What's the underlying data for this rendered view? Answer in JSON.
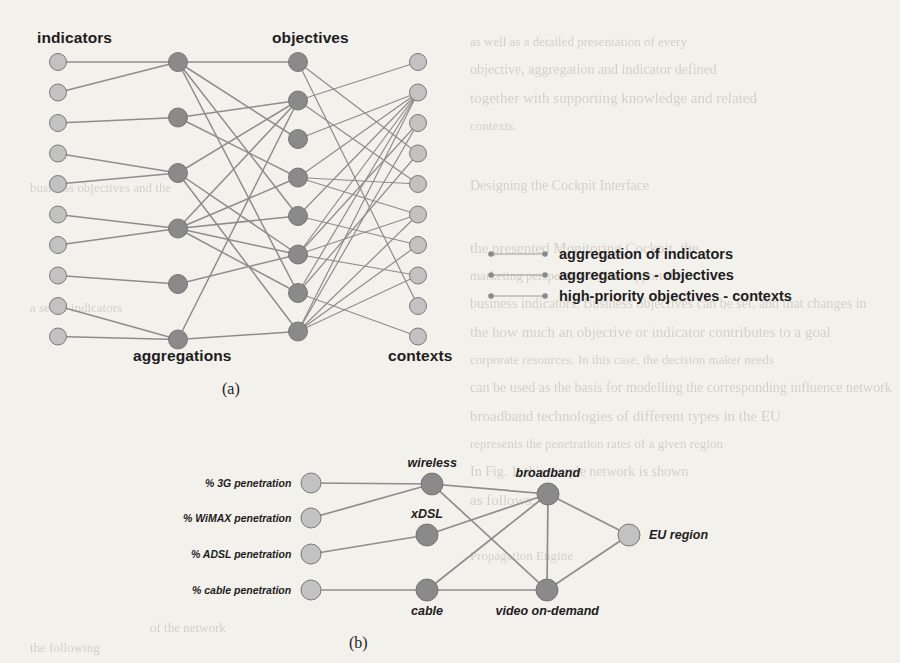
{
  "figure": {
    "panel_a": {
      "caption": "(a)",
      "column_labels": {
        "indicators": "indicators",
        "aggregations": "aggregations",
        "objectives": "objectives",
        "contexts": "contexts"
      },
      "columns": {
        "indicators": {
          "count": 10,
          "x": 58,
          "y0": 62,
          "dy": 30.5,
          "r": 8.5,
          "color": "#c2c2c2"
        },
        "aggregations": {
          "count": 6,
          "x": 178,
          "y0": 62,
          "dy": 55.5,
          "r": 9.5,
          "color": "#8a8a8a"
        },
        "objectives": {
          "count": 8,
          "x": 298,
          "y0": 62,
          "dy": 38.5,
          "r": 9.5,
          "color": "#8a8a8a"
        },
        "contexts": {
          "count": 10,
          "x": 418,
          "y0": 62,
          "dy": 30.5,
          "r": 8.5,
          "color": "#c2c2c2"
        }
      },
      "edges_indicators_aggregations": [
        [
          0,
          0
        ],
        [
          1,
          0
        ],
        [
          2,
          1
        ],
        [
          3,
          2
        ],
        [
          4,
          2
        ],
        [
          5,
          3
        ],
        [
          6,
          3
        ],
        [
          7,
          4
        ],
        [
          8,
          5
        ],
        [
          9,
          5
        ]
      ],
      "edges_aggregations_objectives": [
        [
          0,
          0
        ],
        [
          0,
          2
        ],
        [
          0,
          4
        ],
        [
          0,
          6
        ],
        [
          1,
          1
        ],
        [
          1,
          3
        ],
        [
          2,
          1
        ],
        [
          2,
          5
        ],
        [
          2,
          7
        ],
        [
          3,
          1
        ],
        [
          3,
          3
        ],
        [
          3,
          4
        ],
        [
          3,
          5
        ],
        [
          3,
          6
        ],
        [
          4,
          5
        ],
        [
          5,
          7
        ],
        [
          5,
          1
        ]
      ],
      "edges_objectives_contexts": [
        [
          0,
          3
        ],
        [
          0,
          8
        ],
        [
          1,
          0
        ],
        [
          1,
          4
        ],
        [
          2,
          1
        ],
        [
          3,
          1
        ],
        [
          3,
          4
        ],
        [
          3,
          5
        ],
        [
          4,
          1
        ],
        [
          4,
          6
        ],
        [
          5,
          1
        ],
        [
          5,
          2
        ],
        [
          5,
          5
        ],
        [
          5,
          7
        ],
        [
          6,
          1
        ],
        [
          6,
          3
        ],
        [
          6,
          9
        ],
        [
          7,
          1
        ],
        [
          7,
          2
        ],
        [
          7,
          5
        ],
        [
          7,
          6
        ],
        [
          7,
          7
        ]
      ]
    },
    "legend": {
      "items": [
        {
          "label": "aggregation of indicators"
        },
        {
          "label": "aggregations - objectives"
        },
        {
          "label": "high-priority objectives - contexts"
        }
      ],
      "marker_color": "#8a8a8a",
      "line_color": "#9a9a9a"
    },
    "panel_b": {
      "caption": "(b)",
      "nodes": [
        {
          "id": "3g",
          "label": "% 3G penetration",
          "label_pos": "left",
          "x": 311,
          "y": 483,
          "r": 10,
          "color": "#c2c2c2"
        },
        {
          "id": "wimax",
          "label": "% WiMAX penetration",
          "label_pos": "left",
          "x": 311,
          "y": 518,
          "r": 10,
          "color": "#c2c2c2"
        },
        {
          "id": "adsl",
          "label": "% ADSL penetration",
          "label_pos": "left",
          "x": 311,
          "y": 554,
          "r": 10,
          "color": "#c2c2c2"
        },
        {
          "id": "cable_pen",
          "label": "% cable penetration",
          "label_pos": "left",
          "x": 311,
          "y": 590,
          "r": 10,
          "color": "#c2c2c2"
        },
        {
          "id": "wireless",
          "label": "wireless",
          "label_pos": "top",
          "x": 432,
          "y": 484,
          "r": 11,
          "color": "#8a8a8a"
        },
        {
          "id": "xdsl",
          "label": "xDSL",
          "label_pos": "top",
          "x": 427,
          "y": 535,
          "r": 11,
          "color": "#8a8a8a"
        },
        {
          "id": "cable",
          "label": "cable",
          "label_pos": "bottom",
          "x": 427,
          "y": 590,
          "r": 11,
          "color": "#8a8a8a"
        },
        {
          "id": "broadband",
          "label": "broadband",
          "label_pos": "top",
          "x": 548,
          "y": 494,
          "r": 11,
          "color": "#8a8a8a"
        },
        {
          "id": "vod",
          "label": "video on-demand",
          "label_pos": "bottom",
          "x": 547,
          "y": 590,
          "r": 11,
          "color": "#8a8a8a"
        },
        {
          "id": "eu",
          "label": "EU region",
          "label_pos": "right",
          "x": 629,
          "y": 535,
          "r": 11,
          "color": "#c2c2c2"
        }
      ],
      "edges": [
        [
          "3g",
          "wireless"
        ],
        [
          "wimax",
          "wireless"
        ],
        [
          "adsl",
          "xdsl"
        ],
        [
          "cable_pen",
          "cable"
        ],
        [
          "wireless",
          "broadband"
        ],
        [
          "wireless",
          "vod"
        ],
        [
          "xdsl",
          "broadband"
        ],
        [
          "cable",
          "broadband"
        ],
        [
          "cable",
          "vod"
        ],
        [
          "broadband",
          "vod"
        ],
        [
          "broadband",
          "eu"
        ],
        [
          "vod",
          "eu"
        ]
      ]
    },
    "style": {
      "edge_color": "#8d8d8d",
      "background": "#f3f1ec",
      "node_light": "#c2c2c2",
      "node_dark": "#8a8a8a",
      "node_stroke": "#6e6e6e",
      "text_color": "#1d1d1d"
    }
  },
  "bleed_text": [
    {
      "t": "as well as a detailed presentation of every",
      "x": 470,
      "y": 34
    },
    {
      "t": "objective, aggregation and indicator defined",
      "x": 470,
      "y": 62
    },
    {
      "t": "together with supporting knowledge and related",
      "x": 470,
      "y": 90
    },
    {
      "t": "contexts.",
      "x": 470,
      "y": 118
    },
    {
      "t": "Designing the Cockpit Interface",
      "x": 470,
      "y": 178
    },
    {
      "t": "the presented Monitoring Cockpit, the",
      "x": 470,
      "y": 240
    },
    {
      "t": "marketing perspective and to support the",
      "x": 470,
      "y": 268
    },
    {
      "t": "business indicators. Business objectives can be set, and that changes in",
      "x": 470,
      "y": 296
    },
    {
      "t": "the how much an objective or indicator contributes to a goal",
      "x": 470,
      "y": 324
    },
    {
      "t": "corporate resources. In this case, the decision maker needs",
      "x": 470,
      "y": 352
    },
    {
      "t": "can be used as the basis for modelling the corresponding influence network",
      "x": 470,
      "y": 380
    },
    {
      "t": "broadband technologies of different types in the EU",
      "x": 470,
      "y": 408
    },
    {
      "t": "represents the penetration rates of a given region",
      "x": 470,
      "y": 436
    },
    {
      "t": "In Fig. 1, this simple network is shown",
      "x": 470,
      "y": 464
    },
    {
      "t": "as follows.",
      "x": 470,
      "y": 492
    },
    {
      "t": "Propagation Engine",
      "x": 470,
      "y": 548
    }
  ]
}
